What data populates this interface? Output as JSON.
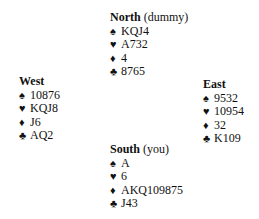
{
  "hands": {
    "north": {
      "name": "North",
      "role": "(dummy)",
      "suits": [
        {
          "suit": "spade-icon",
          "glyph": "♠",
          "cards": "KQJ4"
        },
        {
          "suit": "heart-icon",
          "glyph": "♥",
          "cards": "A732"
        },
        {
          "suit": "diamond-icon",
          "glyph": "♦",
          "cards": "4"
        },
        {
          "suit": "club-icon",
          "glyph": "♣",
          "cards": "8765"
        }
      ]
    },
    "west": {
      "name": "West",
      "role": "",
      "suits": [
        {
          "suit": "spade-icon",
          "glyph": "♠",
          "cards": "10876"
        },
        {
          "suit": "heart-icon",
          "glyph": "♥",
          "cards": "KQJ8"
        },
        {
          "suit": "diamond-icon",
          "glyph": "♦",
          "cards": "J6"
        },
        {
          "suit": "club-icon",
          "glyph": "♣",
          "cards": "AQ2"
        }
      ]
    },
    "east": {
      "name": "East",
      "role": "",
      "suits": [
        {
          "suit": "spade-icon",
          "glyph": "♠",
          "cards": "9532"
        },
        {
          "suit": "heart-icon",
          "glyph": "♥",
          "cards": "10954"
        },
        {
          "suit": "diamond-icon",
          "glyph": "♦",
          "cards": "32"
        },
        {
          "suit": "club-icon",
          "glyph": "♣",
          "cards": "K109"
        }
      ]
    },
    "south": {
      "name": "South",
      "role": "(you)",
      "suits": [
        {
          "suit": "spade-icon",
          "glyph": "♠",
          "cards": "A"
        },
        {
          "suit": "heart-icon",
          "glyph": "♥",
          "cards": "6"
        },
        {
          "suit": "diamond-icon",
          "glyph": "♦",
          "cards": "AKQ109875"
        },
        {
          "suit": "club-icon",
          "glyph": "♣",
          "cards": "J43"
        }
      ]
    }
  }
}
